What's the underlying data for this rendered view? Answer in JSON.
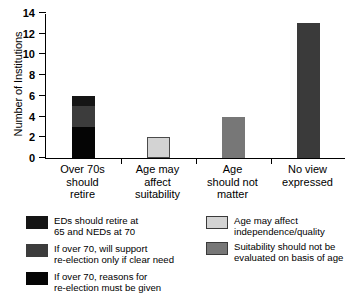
{
  "chart_data": {
    "type": "bar",
    "title": "",
    "xlabel": "",
    "ylabel": "Number of Institutions",
    "ylim": [
      0,
      14
    ],
    "yticks": [
      "0",
      "2",
      "4",
      "6",
      "8",
      "10",
      "12",
      "14"
    ],
    "grid": false,
    "legend_position": "below",
    "categories": [
      "Over 70s\nshould\nretire",
      "Age may\naffect\nsuitability",
      "Age\nshould not\nmatter",
      "No view\nexpressed"
    ],
    "values": [
      6,
      2,
      4,
      13
    ],
    "stacked": true,
    "series": [
      {
        "name": "EDs should retire at\n65 and NEDs at 70",
        "color": "#151515",
        "values": [
          1,
          0,
          0,
          0
        ]
      },
      {
        "name": "If over 70, will support\nre-election only if clear need",
        "color": "#3c3c3c",
        "values": [
          2,
          0,
          0,
          0
        ]
      },
      {
        "name": "If over 70, reasons for\nre-election must be given",
        "color": "#050505",
        "values": [
          3,
          0,
          0,
          0
        ]
      },
      {
        "name": "Age may affect\nindependence/quality",
        "color": "#d3d3d3",
        "values": [
          0,
          2,
          0,
          0
        ]
      },
      {
        "name": "Suitability should not be\nevaluated on basis of age",
        "color": "#777777",
        "values": [
          0,
          0,
          4,
          0
        ]
      },
      {
        "name": "No view expressed",
        "color": "#3a3a3a",
        "values": [
          0,
          0,
          0,
          13
        ]
      }
    ],
    "bar_segments": [
      [
        {
          "label": "If over 70, reasons for re-election must be given",
          "value": 3,
          "color": "#050505"
        },
        {
          "label": "If over 70, will support re-election only if clear need",
          "value": 2,
          "color": "#3c3c3c"
        },
        {
          "label": "EDs should retire at 65 and NEDs at 70",
          "value": 1,
          "color": "#151515"
        }
      ],
      [
        {
          "label": "Age may affect independence/quality",
          "value": 2,
          "color": "#d3d3d3"
        }
      ],
      [
        {
          "label": "Suitability should not be evaluated on basis of age",
          "value": 4,
          "color": "#777777"
        }
      ],
      [
        {
          "label": "No view expressed",
          "value": 13,
          "color": "#3a3a3a"
        }
      ]
    ]
  },
  "axis": {
    "ylabel": "Number of Institutions",
    "yticks": [
      "14",
      "12",
      "10",
      "8",
      "6",
      "4",
      "2",
      "0"
    ]
  },
  "xlabels": [
    "Over 70s\nshould\nretire",
    "Age may\naffect\nsuitability",
    "Age\nshould not\nmatter",
    "No view\nexpressed"
  ],
  "legend": {
    "left": [
      {
        "swatch": "#151515",
        "text": "EDs should retire at\n65 and NEDs at 70"
      },
      {
        "swatch": "#3c3c3c",
        "text": "If over 70, will support\nre-election only if clear need"
      },
      {
        "swatch": "#050505",
        "text": "If over 70, reasons for\nre-election must be given"
      }
    ],
    "right": [
      {
        "swatch": "#d3d3d3",
        "text": "Age may affect\nindependence/quality"
      },
      {
        "swatch": "#777777",
        "text": "Suitability should not be\nevaluated on basis of age"
      }
    ]
  }
}
